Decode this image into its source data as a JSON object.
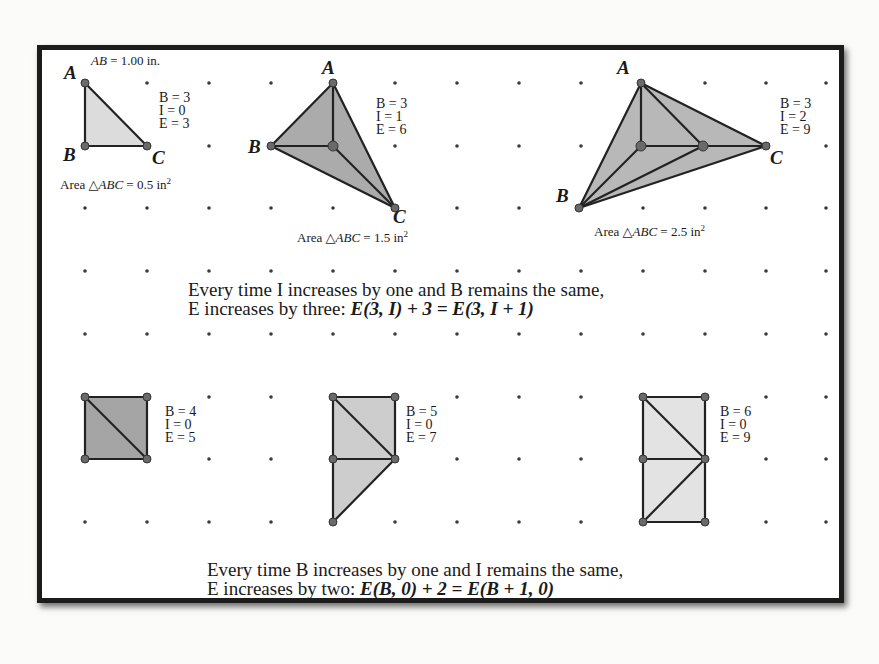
{
  "frame": {
    "scale_label": {
      "lhs": "AB",
      "rhs": "= 1.00 in."
    },
    "grid": {
      "x": [
        85,
        147,
        209,
        271,
        333,
        395,
        457,
        519,
        581,
        643,
        705,
        766,
        826
      ],
      "y": [
        83,
        146,
        208,
        271,
        334,
        397,
        459,
        522
      ]
    },
    "top_row": [
      {
        "vertices": {
          "A": "A",
          "B": "B",
          "C": "C"
        },
        "stats": {
          "B": "B = 3",
          "I": "I = 0",
          "E": "E = 3"
        },
        "area": {
          "prefix": "Area △",
          "tri": "ABC",
          "eq": " = 0.5 in",
          "exp": "2"
        },
        "fill": "#dcdcdc"
      },
      {
        "vertices": {
          "A": "A",
          "B": "B",
          "C": "C"
        },
        "stats": {
          "B": "B = 3",
          "I": "I = 1",
          "E": "E = 6"
        },
        "area": {
          "prefix": "Area △",
          "tri": "ABC",
          "eq": " = 1.5 in",
          "exp": "2"
        },
        "fill": "#ababab"
      },
      {
        "vertices": {
          "A": "A",
          "B": "B",
          "C": "C"
        },
        "stats": {
          "B": "B = 3",
          "I": "I = 2",
          "E": "E = 9"
        },
        "area": {
          "prefix": "Area △",
          "tri": "ABC",
          "eq": " = 2.5 in",
          "exp": "2"
        },
        "fill": "#b8b8b8"
      }
    ],
    "note_top": {
      "line1": "Every time I increases by one and B remains the same,",
      "line2_plain": "E increases by three: ",
      "line2_formula": "E(3, I) + 3 = E(3, I + 1)"
    },
    "bottom_row": [
      {
        "stats": {
          "B": "B = 4",
          "I": "I = 0",
          "E": "E = 5"
        },
        "fill": "#a5a5a5"
      },
      {
        "stats": {
          "B": "B = 5",
          "I": "I = 0",
          "E": "E = 7"
        },
        "fill": "#cdcdcd"
      },
      {
        "stats": {
          "B": "B = 6",
          "I": "I = 0",
          "E": "E = 9"
        },
        "fill": "#e3e3e3"
      }
    ],
    "note_bottom": {
      "line1": "Every time B increases by one and I remains the same,",
      "line2_plain": "E increases by two: ",
      "line2_formula": "E(B, 0) + 2 = E(B + 1, 0)"
    }
  }
}
